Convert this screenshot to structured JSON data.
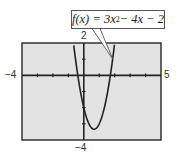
{
  "chart_data": {
    "type": "line",
    "title": "",
    "function_label": {
      "prefix": "f(x) = 3x",
      "exponent": "2",
      "suffix": " − 4x − 2"
    },
    "expression": "f(x) = 3x^2 - 4x - 2",
    "window": {
      "xmin": -4,
      "xmax": 5,
      "ymin": -4,
      "ymax": 2,
      "xscl": 1,
      "yscl": 1
    },
    "tick_labels": {
      "xmin": "−4",
      "xmax": "5",
      "ymax": "2",
      "ymin": "−4"
    },
    "series": [
      {
        "name": "f(x) = 3x^2 - 4x - 2",
        "x": [
          -1.0,
          -0.8,
          -0.6,
          -0.4,
          -0.2,
          0.0,
          0.2,
          0.4,
          0.6,
          0.8,
          1.0,
          1.2,
          1.4,
          1.6,
          1.8,
          2.0,
          2.2
        ],
        "y": [
          5.0,
          2.12,
          -0.52,
          -0.92,
          -1.08,
          -2.0,
          -2.68,
          -3.12,
          -3.32,
          -3.28,
          -3.0,
          -2.48,
          -1.72,
          -0.72,
          0.52,
          2.0,
          3.72
        ]
      }
    ],
    "xlabel": "",
    "ylabel": "",
    "grid": false,
    "legend": "callout box with pointer to curve"
  },
  "colors": {
    "screen_bg": "#e3e3e3",
    "frame": "#333333",
    "curve": "#222222",
    "axis": "#222222"
  }
}
